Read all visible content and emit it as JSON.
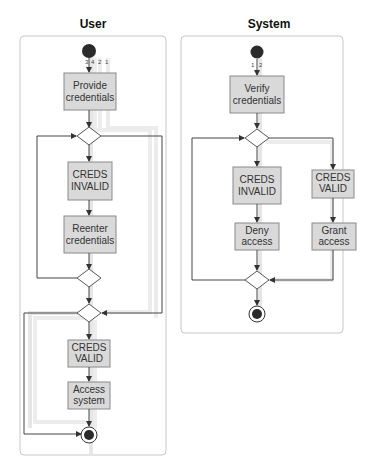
{
  "diagram": {
    "type": "uml-activity-diagram",
    "lanes": [
      {
        "id": "user",
        "title": "User",
        "path_labels": [
          "3",
          "4",
          "2",
          "1"
        ],
        "nodes": [
          {
            "id": "u_start",
            "kind": "initial"
          },
          {
            "id": "u_provide",
            "kind": "action",
            "lines": [
              "Provide",
              "credentials"
            ]
          },
          {
            "id": "u_dec1",
            "kind": "decision"
          },
          {
            "id": "u_invalid",
            "kind": "action",
            "lines": [
              "CREDS",
              "INVALID"
            ]
          },
          {
            "id": "u_reenter",
            "kind": "action",
            "lines": [
              "Reenter",
              "credentials"
            ]
          },
          {
            "id": "u_dec2",
            "kind": "decision"
          },
          {
            "id": "u_dec3",
            "kind": "decision"
          },
          {
            "id": "u_valid",
            "kind": "action",
            "lines": [
              "CREDS",
              "VALID"
            ]
          },
          {
            "id": "u_access",
            "kind": "action",
            "lines": [
              "Access",
              "system"
            ]
          },
          {
            "id": "u_end",
            "kind": "final"
          }
        ]
      },
      {
        "id": "system",
        "title": "System",
        "path_labels": [
          "1",
          "2"
        ],
        "nodes": [
          {
            "id": "s_start",
            "kind": "initial"
          },
          {
            "id": "s_verify",
            "kind": "action",
            "lines": [
              "Verify",
              "credentials"
            ]
          },
          {
            "id": "s_dec1",
            "kind": "decision"
          },
          {
            "id": "s_invalid",
            "kind": "action",
            "lines": [
              "CREDS",
              "INVALID"
            ]
          },
          {
            "id": "s_valid",
            "kind": "action",
            "lines": [
              "CREDS",
              "VALID"
            ]
          },
          {
            "id": "s_deny",
            "kind": "action",
            "lines": [
              "Deny",
              "access"
            ]
          },
          {
            "id": "s_grant",
            "kind": "action",
            "lines": [
              "Grant",
              "access"
            ]
          },
          {
            "id": "s_dec2",
            "kind": "decision"
          },
          {
            "id": "s_end",
            "kind": "final"
          }
        ]
      }
    ],
    "colors": {
      "action_fill": "#d9d9d9",
      "action_stroke": "#8a8a8a",
      "edge": "#444444",
      "path_highlight": "#e6e6e6",
      "lane_border": "#c8c8c8"
    }
  }
}
